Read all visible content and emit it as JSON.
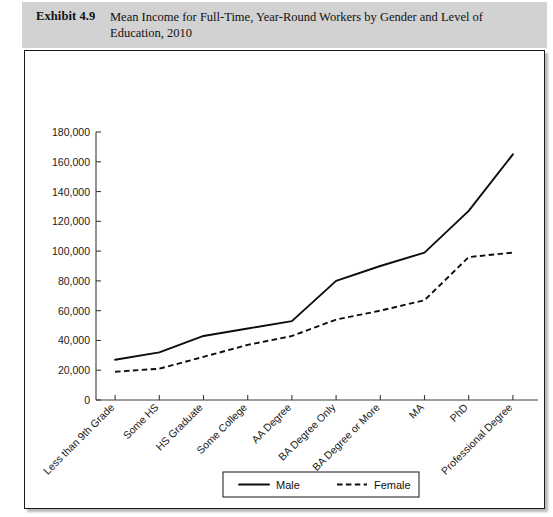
{
  "header": {
    "exhibit_label": "Exhibit 4.9",
    "title": "Mean Income for Full-Time, Year-Round Workers by Gender and Level of Education, 2010",
    "background_color": "#d2d2d2"
  },
  "chart_data": {
    "type": "line",
    "title": "Mean Income for Full-Time, Year-Round Workers by Gender and Level of Education, 2010",
    "xlabel": "",
    "ylabel": "",
    "grid": false,
    "legend_position": "bottom-center",
    "ylim": [
      0,
      180000
    ],
    "ytick_labels": [
      "180,000",
      "160,000",
      "140,000",
      "120,000",
      "100,000",
      "80,000",
      "60,000",
      "40,000",
      "20,000",
      "0"
    ],
    "ytick_values": [
      180000,
      160000,
      140000,
      120000,
      100000,
      80000,
      60000,
      40000,
      20000,
      0
    ],
    "ytick_step": 20000,
    "categories": [
      "Less than 9th Grade",
      "Some HS",
      "HS Graduate",
      "Some College",
      "AA Degree",
      "BA Degree Only",
      "BA Degree or More",
      "MA",
      "PhD",
      "Professional Degree"
    ],
    "series": [
      {
        "name": "Male",
        "line_style": "solid",
        "color": "#0d0d0d",
        "values": [
          27000,
          32000,
          43000,
          48000,
          53000,
          80000,
          90000,
          99000,
          127000,
          165000
        ]
      },
      {
        "name": "Female",
        "line_style": "dashed",
        "color": "#0d0d0d",
        "values": [
          19000,
          21000,
          29000,
          37000,
          43000,
          54000,
          60000,
          67000,
          96000,
          99000
        ]
      }
    ]
  },
  "legend": {
    "items": [
      {
        "label": "Male",
        "style": "solid"
      },
      {
        "label": "Female",
        "style": "dashed"
      }
    ]
  }
}
